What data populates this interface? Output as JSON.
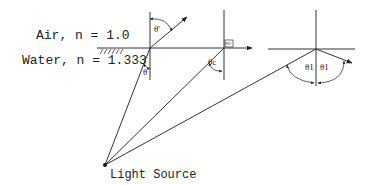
{
  "diagram": {
    "media": {
      "upper": {
        "label": "Air, n = 1.0",
        "name": "Air",
        "n": 1.0
      },
      "lower": {
        "label": "Water, n = 1.333",
        "name": "Water",
        "n": 1.333
      }
    },
    "source_label": "Light Source",
    "angles": {
      "refracted": "θ'",
      "incident": "θ",
      "critical": "θc",
      "reflect_in": "θ1",
      "reflect_out": "θ1",
      "right_angle": "90°"
    },
    "colors": {
      "line": "#333333",
      "background": "#ffffff",
      "text": "#222222"
    }
  }
}
